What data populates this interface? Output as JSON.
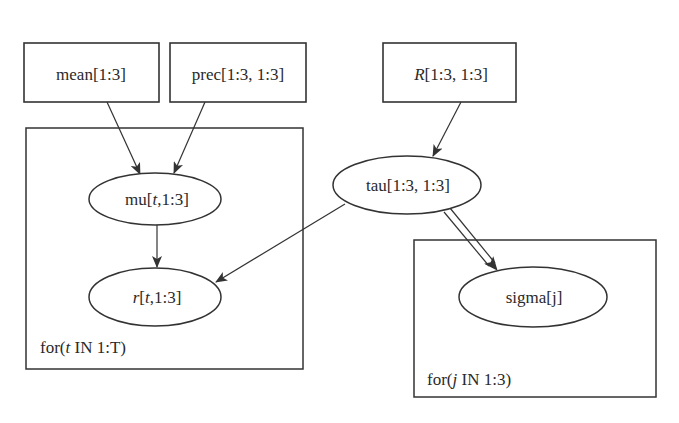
{
  "diagram": {
    "type": "graphical-model",
    "colors": {
      "line": "#333333",
      "text": "#2a2a2a",
      "background": "#ffffff"
    },
    "nodes": {
      "mean": {
        "kind": "constant",
        "shape": "rectangle",
        "label": "mean[1:3]"
      },
      "prec": {
        "kind": "constant",
        "shape": "rectangle",
        "label": "prec[1:3, 1:3]"
      },
      "R": {
        "kind": "constant",
        "shape": "rectangle",
        "label_italic": "R",
        "label_rest": "[1:3, 1:3]"
      },
      "mu": {
        "kind": "stochastic",
        "shape": "ellipse",
        "label_pre": "mu[",
        "label_italic": "t",
        "label_post": ",1:3]"
      },
      "r": {
        "kind": "stochastic",
        "shape": "ellipse",
        "label_italic": "r",
        "label_mid": "[",
        "label_italic2": "t",
        "label_post": ",1:3]"
      },
      "tau": {
        "kind": "stochastic",
        "shape": "ellipse",
        "label": "tau[1:3, 1:3]"
      },
      "sigma": {
        "kind": "logical",
        "shape": "ellipse",
        "label": "sigma[j]"
      }
    },
    "plates": {
      "t_plate": {
        "label_pre": "for(",
        "label_italic": "t",
        "label_post": " IN 1:T)",
        "contains": [
          "mu",
          "r"
        ]
      },
      "j_plate": {
        "label_pre": "for(",
        "label_italic": "j",
        "label_post": " IN 1:3)",
        "contains": [
          "sigma"
        ]
      }
    },
    "edges": [
      {
        "from": "mean",
        "to": "mu",
        "style": "single"
      },
      {
        "from": "prec",
        "to": "mu",
        "style": "single"
      },
      {
        "from": "mu",
        "to": "r",
        "style": "single"
      },
      {
        "from": "R",
        "to": "tau",
        "style": "single"
      },
      {
        "from": "tau",
        "to": "r",
        "style": "single"
      },
      {
        "from": "tau",
        "to": "sigma",
        "style": "double"
      }
    ]
  }
}
